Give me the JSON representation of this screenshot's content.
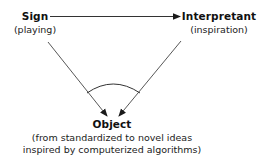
{
  "diagram": {
    "type": "semiotic-triangle",
    "nodes": {
      "sign": {
        "title": "Sign",
        "subtitle": "(playing)"
      },
      "interpretant": {
        "title": "Interpretant",
        "subtitle": "(inspiration)"
      },
      "object": {
        "title": "Object",
        "subtitle_line1": "(from standardized to novel ideas",
        "subtitle_line2": "inspired by computerized algorithms)"
      }
    },
    "edges": [
      {
        "from": "Sign",
        "to": "Interpretant",
        "style": "arrow"
      },
      {
        "from": "Sign",
        "to": "Object",
        "style": "arrow"
      },
      {
        "from": "Interpretant",
        "to": "Object",
        "style": "arrow"
      }
    ],
    "annotations": [
      "arc-between-incoming-edges-at-object"
    ],
    "colors": {
      "line": "#333333",
      "text": "#111111",
      "background": "#ffffff"
    }
  }
}
